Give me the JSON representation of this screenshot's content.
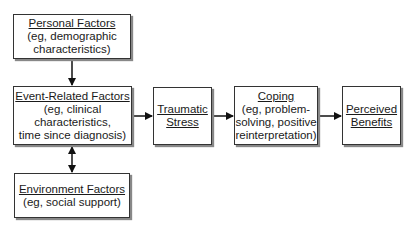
{
  "diagram": {
    "nodes": [
      {
        "id": "personal",
        "title": "Personal Factors",
        "detail": [
          "(eg, demographic",
          "characteristics)"
        ]
      },
      {
        "id": "event",
        "title": "Event-Related Factors",
        "detail": [
          "(eg, clinical",
          "characteristics,",
          "time since diagnosis)"
        ]
      },
      {
        "id": "environment",
        "title": "Environment Factors",
        "detail": [
          "(eg, social support)"
        ]
      },
      {
        "id": "trauma",
        "title_lines": [
          "Traumatic",
          "Stress"
        ]
      },
      {
        "id": "coping",
        "title": "Coping",
        "detail": [
          "(eg, problem-",
          "solving, positive",
          "reinterpretation)"
        ]
      },
      {
        "id": "benefits",
        "title_lines": [
          "Perceived",
          "Benefits"
        ]
      }
    ],
    "edges": [
      {
        "from": "personal",
        "to": "event",
        "type": "one-way"
      },
      {
        "from": "event",
        "to": "environment",
        "type": "two-way"
      },
      {
        "from": "event",
        "to": "trauma",
        "type": "one-way"
      },
      {
        "from": "trauma",
        "to": "coping",
        "type": "one-way"
      },
      {
        "from": "coping",
        "to": "benefits",
        "type": "one-way"
      }
    ]
  }
}
